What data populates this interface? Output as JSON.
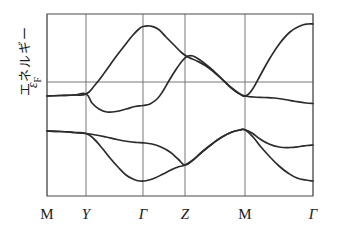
{
  "figure": {
    "title": "",
    "y_axis_label": "エネルギー",
    "fermi_label_symbol": "ε",
    "fermi_label_sub": "F"
  },
  "chart_data": {
    "type": "line",
    "title": "",
    "xlabel": "",
    "ylabel": "エネルギー",
    "grid": true,
    "legend_position": "none",
    "x_tick_labels": [
      "M",
      "Y",
      "Γ",
      "Z",
      "M",
      "Γ"
    ],
    "x_tick_positions": [
      0.0,
      0.1466,
      0.3609,
      0.5188,
      0.7444,
      1.0
    ],
    "annotations": [
      {
        "text": "ε_F",
        "type": "fermi-level",
        "y": 0.0
      }
    ],
    "axis_box": {
      "x0": 47,
      "y0": 14,
      "x1": 313,
      "y1": 196
    },
    "fermi_level_y_px": 82,
    "ylim": [
      -1.0,
      1.0
    ],
    "series": [
      {
        "name": "conduction-band-1",
        "points_px": [
          [
            47,
            96
          ],
          [
            60,
            95.5
          ],
          [
            74,
            95
          ],
          [
            86,
            94
          ],
          [
            95,
            85
          ],
          [
            105,
            72
          ],
          [
            115,
            58
          ],
          [
            125,
            45
          ],
          [
            133,
            35
          ],
          [
            139,
            29
          ],
          [
            143,
            26.5
          ],
          [
            150,
            26
          ],
          [
            158,
            29
          ],
          [
            166,
            37
          ],
          [
            174,
            45
          ],
          [
            182,
            53
          ],
          [
            189,
            57.5
          ],
          [
            197,
            61
          ],
          [
            206,
            66
          ],
          [
            215,
            73
          ],
          [
            224,
            81
          ],
          [
            233,
            89
          ],
          [
            240,
            94
          ],
          [
            245,
            96
          ],
          [
            252,
            90
          ],
          [
            261,
            74
          ],
          [
            270,
            58
          ],
          [
            280,
            43
          ],
          [
            290,
            32
          ],
          [
            300,
            26
          ],
          [
            308,
            24
          ],
          [
            313,
            24
          ]
        ]
      },
      {
        "name": "conduction-band-2",
        "points_px": [
          [
            47,
            96
          ],
          [
            60,
            95.5
          ],
          [
            74,
            95
          ],
          [
            86,
            94
          ],
          [
            92,
            103
          ],
          [
            99,
            109
          ],
          [
            107,
            112
          ],
          [
            116,
            111.5
          ],
          [
            126,
            109
          ],
          [
            135,
            106.5
          ],
          [
            143,
            105.5
          ],
          [
            150,
            104
          ],
          [
            157,
            99
          ],
          [
            163,
            91
          ],
          [
            170,
            79
          ],
          [
            177,
            68
          ],
          [
            183,
            60
          ],
          [
            188,
            56
          ],
          [
            193,
            56
          ],
          [
            200,
            60
          ],
          [
            209,
            67
          ],
          [
            219,
            76
          ],
          [
            229,
            86
          ],
          [
            238,
            93
          ],
          [
            245,
            96
          ],
          [
            254,
            97
          ],
          [
            264,
            97.5
          ],
          [
            274,
            98
          ],
          [
            285,
            99.5
          ],
          [
            296,
            101.5
          ],
          [
            306,
            103
          ],
          [
            313,
            103.5
          ]
        ]
      },
      {
        "name": "valence-band-1",
        "points_px": [
          [
            47,
            131
          ],
          [
            60,
            131.5
          ],
          [
            74,
            132.5
          ],
          [
            86,
            133.5
          ],
          [
            96,
            135
          ],
          [
            106,
            137
          ],
          [
            117,
            139.5
          ],
          [
            128,
            141.5
          ],
          [
            137,
            142.5
          ],
          [
            143,
            142.8
          ],
          [
            152,
            144
          ],
          [
            161,
            147
          ],
          [
            170,
            152
          ],
          [
            178,
            159
          ],
          [
            185,
            165
          ],
          [
            193,
            160
          ],
          [
            202,
            152
          ],
          [
            212,
            144
          ],
          [
            222,
            137
          ],
          [
            232,
            132
          ],
          [
            240,
            130
          ],
          [
            245,
            129.8
          ],
          [
            252,
            133
          ],
          [
            260,
            139
          ],
          [
            269,
            144
          ],
          [
            279,
            147
          ],
          [
            290,
            147.5
          ],
          [
            300,
            146.5
          ],
          [
            307,
            145.5
          ],
          [
            313,
            145
          ]
        ]
      },
      {
        "name": "valence-band-2",
        "points_px": [
          [
            47,
            131
          ],
          [
            60,
            131.5
          ],
          [
            74,
            132.5
          ],
          [
            86,
            133.5
          ],
          [
            94,
            139
          ],
          [
            102,
            148
          ],
          [
            110,
            158
          ],
          [
            118,
            167
          ],
          [
            126,
            175
          ],
          [
            134,
            179.5
          ],
          [
            140,
            181
          ],
          [
            147,
            180.5
          ],
          [
            155,
            178
          ],
          [
            163,
            174
          ],
          [
            171,
            170
          ],
          [
            178,
            167
          ],
          [
            185,
            165
          ],
          [
            193,
            160
          ],
          [
            202,
            152
          ],
          [
            212,
            144
          ],
          [
            222,
            137
          ],
          [
            232,
            132
          ],
          [
            240,
            130
          ],
          [
            245,
            129.8
          ],
          [
            253,
            137
          ],
          [
            261,
            147
          ],
          [
            270,
            157
          ],
          [
            279,
            166
          ],
          [
            288,
            173
          ],
          [
            297,
            178
          ],
          [
            306,
            180
          ],
          [
            313,
            181
          ]
        ]
      }
    ]
  }
}
